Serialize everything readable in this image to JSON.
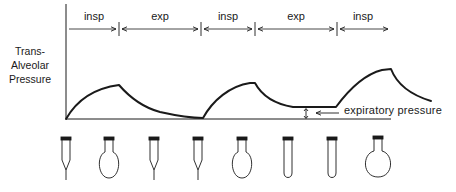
{
  "y_axis_label": [
    "Trans-",
    "Alveolar",
    "Pressure"
  ],
  "phases": [
    {
      "label": "insp",
      "x_start": 68,
      "x_end": 118
    },
    {
      "label": "exp",
      "x_start": 120,
      "x_end": 200
    },
    {
      "label": "insp",
      "x_start": 202,
      "x_end": 254
    },
    {
      "label": "exp",
      "x_start": 256,
      "x_end": 336
    },
    {
      "label": "insp",
      "x_start": 338,
      "x_end": 389
    }
  ],
  "annotation": {
    "label": "expiratory pressure"
  },
  "alveoli_shapes": [
    "collapsed",
    "inflated",
    "collapsed",
    "collapsed",
    "inflated",
    "partially-open",
    "partially-open",
    "inflated-large"
  ],
  "colors": {
    "line": "#1a1a1a",
    "background": "#ffffff"
  }
}
